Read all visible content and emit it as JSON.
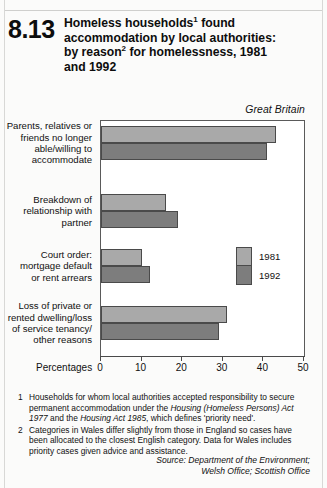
{
  "figure": {
    "number": "8.13",
    "title_line1": "Homeless households",
    "title_sup1": "1",
    "title_line1b": " found",
    "title_line2": "accommodation by local authorities:",
    "title_line3a": "by reason",
    "title_sup2": "2",
    "title_line3b": " for homelessness, 1981",
    "title_line4": "and 1992",
    "panel_note": "Great Britain",
    "axis_caption": "Percentages"
  },
  "footnotes": [
    {
      "marker": "1",
      "text_a": "Households for whom local authorities accepted responsibility to secure permanent accommodation under the ",
      "italic_a": "Housing (Homeless Persons) Act 1977",
      "text_b": " and the ",
      "italic_b": "Housing Act 1985",
      "text_c": ", which defines 'priority need'."
    },
    {
      "marker": "2",
      "text_a": "Categories in Wales differ slightly from those in England so cases have been allocated to the closest English category. Data for Wales includes priority cases given advice and assistance.",
      "italic_a": "",
      "text_b": "",
      "italic_b": "",
      "text_c": ""
    }
  ],
  "source_line1": "Source: Department of the Environment;",
  "source_line2": "Welsh Office; Scottish Office",
  "colors": {
    "series_1981": "#a9a9a9",
    "series_1992": "#7d7d7d",
    "frame": "#5a5a5a",
    "page_background": "#fbfbfa"
  },
  "chart_data": {
    "type": "bar",
    "orientation": "horizontal",
    "subtitle": "Great Britain",
    "xlabel": "Percentages",
    "ylabel": "",
    "xlim": [
      0,
      50
    ],
    "xticks": [
      0,
      10,
      20,
      30,
      40,
      50
    ],
    "xtick_labels": [
      "0",
      "10",
      "20",
      "30",
      "40",
      "50"
    ],
    "grid": false,
    "legend_position": "middle-right-inside",
    "categories": [
      "Parents, relatives or friends no longer able/willing to accommodate",
      "Breakdown of relationship with partner",
      "Court order: mortgage default or rent arrears",
      "Loss of private or rented dwelling/loss of service tenancy/ other reasons"
    ],
    "category_lines": [
      [
        "Parents, relatives or",
        "friends no longer",
        "able/willing to",
        "accommodate"
      ],
      [
        "Breakdown of",
        "relationship with",
        "partner"
      ],
      [
        "Court order:",
        "mortgage default",
        "or rent arrears"
      ],
      [
        "Loss of private or",
        "rented dwelling/loss",
        "of service tenancy/",
        "other reasons"
      ]
    ],
    "series": [
      {
        "name": "1981",
        "color": "#a9a9a9",
        "values": [
          43,
          16,
          10,
          31
        ]
      },
      {
        "name": "1992",
        "color": "#7d7d7d",
        "values": [
          41,
          19,
          12,
          29
        ]
      }
    ]
  }
}
